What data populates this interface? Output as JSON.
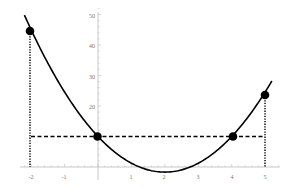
{
  "chart_data": {
    "type": "line",
    "title": "",
    "xlabel": "",
    "ylabel": "",
    "xlim": [
      -2.1,
      5.3
    ],
    "ylim": [
      -2,
      52
    ],
    "grid": false,
    "x_ticks": [
      -2,
      -1,
      1,
      2,
      3,
      4,
      5
    ],
    "x_tick_labels": [
      "-2",
      "-1",
      "1",
      "2",
      "3",
      "4",
      "5"
    ],
    "y_ticks": [
      20,
      30,
      40,
      50
    ],
    "y_tick_labels": [
      "20",
      "30",
      "40",
      "50"
    ],
    "series": [
      {
        "name": "parabola",
        "equation": "y = (35/12)(x-2)^2 - 5/3",
        "x": [
          -2.2,
          -2,
          -1,
          0,
          1,
          2,
          3,
          4,
          5,
          5.2
        ],
        "values": [
          49.8,
          45,
          24.6,
          10,
          1.25,
          -1.67,
          1.25,
          10,
          24.6,
          28.2
        ]
      }
    ],
    "points": [
      {
        "x": -2,
        "y": 45
      },
      {
        "x": 0,
        "y": 10
      },
      {
        "x": 4,
        "y": 10
      },
      {
        "x": 5,
        "y": 24.6
      }
    ],
    "annotations": [
      {
        "type": "horizontal-dashed",
        "y": 10,
        "x_from": -2,
        "x_to": 5
      },
      {
        "type": "vertical-dotted",
        "x": -2,
        "y_from": 0,
        "y_to": 45
      },
      {
        "type": "vertical-dotted",
        "x": 5,
        "y_from": 0,
        "y_to": 24.6
      }
    ],
    "colors": {
      "curve": "#000000",
      "axes": "#bbbbbb",
      "labels": "#777777"
    }
  }
}
